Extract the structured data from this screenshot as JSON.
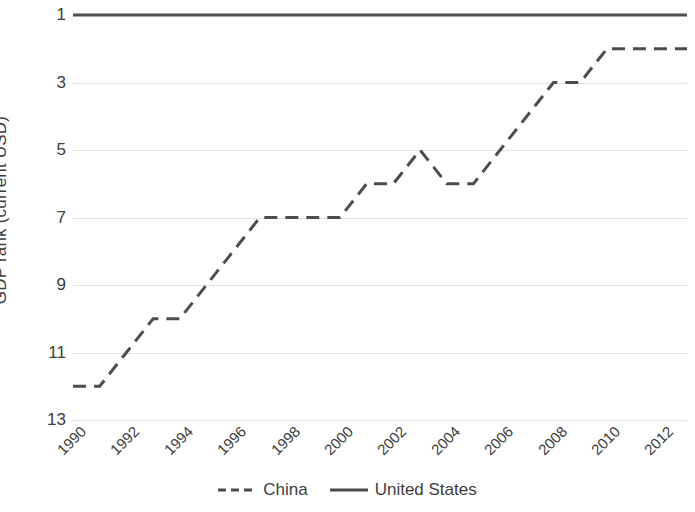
{
  "chart_data": {
    "type": "line",
    "title": "",
    "xlabel": "",
    "ylabel": "GDP rank (current USD)",
    "x": [
      1990,
      1991,
      1992,
      1993,
      1994,
      1995,
      1996,
      1997,
      1998,
      1999,
      2000,
      2001,
      2002,
      2003,
      2004,
      2005,
      2006,
      2007,
      2008,
      2009,
      2010,
      2011,
      2012,
      2013
    ],
    "xlim": [
      1990,
      2013
    ],
    "ylim": [
      1,
      13
    ],
    "y_inverted": true,
    "grid": true,
    "legend_position": "bottom",
    "xtick_labels": [
      "1990",
      "1992",
      "1994",
      "1996",
      "1998",
      "2000",
      "2002",
      "2004",
      "2006",
      "2008",
      "2010",
      "2012"
    ],
    "xtick_values": [
      1990,
      1992,
      1994,
      1996,
      1998,
      2000,
      2002,
      2004,
      2006,
      2008,
      2010,
      2012
    ],
    "ytick_labels": [
      "1",
      "3",
      "5",
      "7",
      "9",
      "11",
      "13"
    ],
    "ytick_values": [
      1,
      3,
      5,
      7,
      9,
      11,
      13
    ],
    "series": [
      {
        "name": "China",
        "style": "dashed",
        "color": "#4d4d4d",
        "values": [
          12,
          12,
          11,
          10,
          10,
          9,
          8,
          7,
          7,
          7,
          7,
          6,
          6,
          5,
          6,
          6,
          5,
          4,
          3,
          3,
          2,
          2,
          2,
          2
        ]
      },
      {
        "name": "United States",
        "style": "solid",
        "color": "#4d4d4d",
        "values": [
          1,
          1,
          1,
          1,
          1,
          1,
          1,
          1,
          1,
          1,
          1,
          1,
          1,
          1,
          1,
          1,
          1,
          1,
          1,
          1,
          1,
          1,
          1,
          1
        ]
      }
    ]
  },
  "legend": {
    "entries": [
      {
        "label": "China"
      },
      {
        "label": "United States"
      }
    ]
  }
}
